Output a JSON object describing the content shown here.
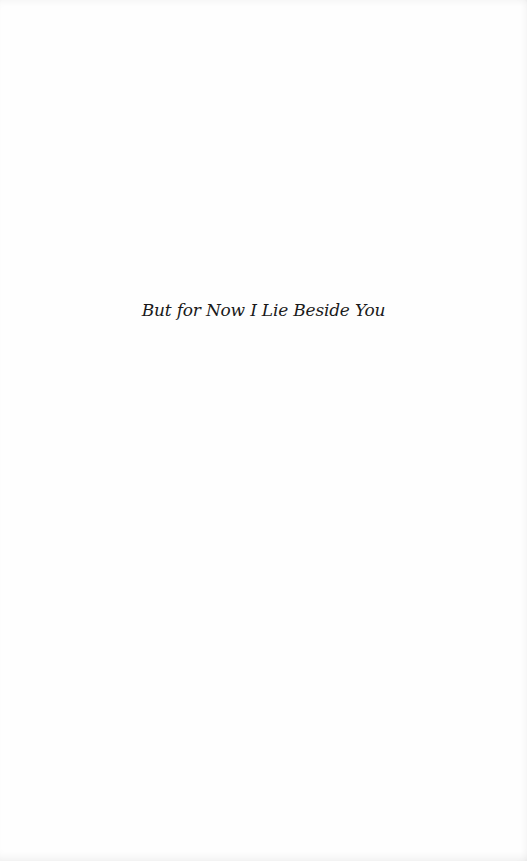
{
  "page": {
    "type": "half-title page",
    "title": "But for Now I Lie Beside You",
    "background_color": "#fefefe",
    "text_color": "#1a1a1a"
  }
}
